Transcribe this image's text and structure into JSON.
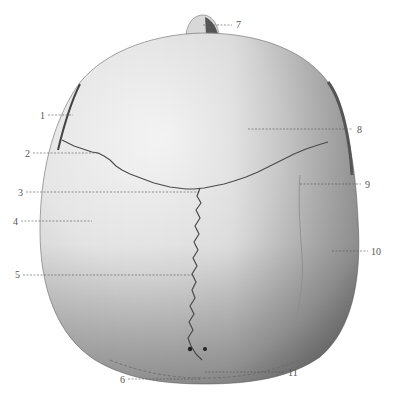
{
  "figure": {
    "colors": {
      "background": "#ffffff",
      "bone_light": "#f2f2f2",
      "bone_mid": "#cfcfcf",
      "bone_dark": "#8a8a8a",
      "suture": "#4a4a4a",
      "leader": "#555555"
    }
  },
  "labels": [
    {
      "id": "1",
      "text": "1",
      "x": 40,
      "y": 111
    },
    {
      "id": "2",
      "text": "2",
      "x": 25,
      "y": 149
    },
    {
      "id": "3",
      "text": "3",
      "x": 18,
      "y": 188
    },
    {
      "id": "4",
      "text": "4",
      "x": 13,
      "y": 217
    },
    {
      "id": "5",
      "text": "5",
      "x": 15,
      "y": 270
    },
    {
      "id": "6",
      "text": "6",
      "x": 120,
      "y": 375
    },
    {
      "id": "7",
      "text": "7",
      "x": 237,
      "y": 21
    },
    {
      "id": "8",
      "text": "8",
      "x": 358,
      "y": 125
    },
    {
      "id": "9",
      "text": "9",
      "x": 366,
      "y": 180
    },
    {
      "id": "10",
      "text": "10",
      "x": 372,
      "y": 247
    },
    {
      "id": "11",
      "text": "11",
      "x": 288,
      "y": 368
    }
  ]
}
